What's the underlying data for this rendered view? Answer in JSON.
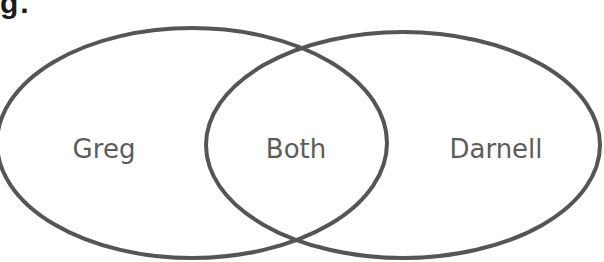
{
  "header": {
    "clipped_label": "g."
  },
  "diagram": {
    "type": "venn",
    "stroke_color": "#555555",
    "text_color": "#5c5c5c",
    "sets": [
      {
        "name": "left",
        "label": "Greg",
        "cx": 192,
        "cy": 143,
        "rx": 195,
        "ry": 115
      },
      {
        "name": "right",
        "label": "Darnell",
        "cx": 403,
        "cy": 145,
        "rx": 197,
        "ry": 113
      }
    ],
    "intersection_label": "Both",
    "labels": {
      "left": "Greg",
      "center": "Both",
      "right": "Darnell"
    }
  }
}
